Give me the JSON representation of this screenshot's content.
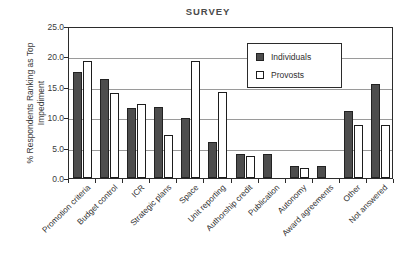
{
  "chart_data": {
    "type": "bar",
    "title": "SURVEY",
    "xlabel": "",
    "ylabel_line1": "% Respondents Ranking as Top",
    "ylabel_line2": "Impediment",
    "ylim": [
      0.0,
      25.0
    ],
    "ytick_labels": [
      "0.0",
      "5.0",
      "10.0",
      "15.0",
      "20.0",
      "25.0"
    ],
    "ytick_values": [
      0.0,
      5.0,
      10.0,
      15.0,
      20.0,
      25.0
    ],
    "grid": "horizontal",
    "legend_position": "upper-right-inside",
    "categories": [
      "Promotion criteria",
      "Budget control",
      "ICR",
      "Strategic plans",
      "Space",
      "Unit reporting",
      "Authorship credit",
      "Publication",
      "Autonomy",
      "Award agreements",
      "Other",
      "Not answered"
    ],
    "series": [
      {
        "name": "Individuals",
        "color": "#4d4d4d",
        "values": [
          17.4,
          16.3,
          11.5,
          11.7,
          9.9,
          5.9,
          3.9,
          3.9,
          1.9,
          1.9,
          11.1,
          15.5
        ]
      },
      {
        "name": "Provosts",
        "color": "#ffffff",
        "values": [
          19.3,
          14.0,
          12.2,
          7.0,
          19.3,
          14.1,
          3.6,
          0.0,
          1.7,
          0.0,
          8.7,
          8.7
        ]
      }
    ]
  }
}
